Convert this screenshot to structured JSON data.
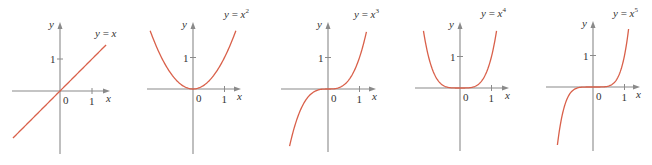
{
  "chart_data": [
    {
      "type": "line",
      "title": "y = x",
      "function": "x",
      "exponent": 1,
      "xlabel": "x",
      "ylabel": "y",
      "x_ticks": [
        "0",
        "1"
      ],
      "y_ticks": [
        "1"
      ],
      "xlim": [
        -1.5,
        1.5
      ],
      "ylim": [
        -1.5,
        1.6
      ],
      "x": [
        -1.5,
        -1,
        -0.5,
        0,
        0.5,
        1,
        1.5
      ],
      "y": [
        -1.5,
        -1,
        -0.5,
        0,
        0.5,
        1,
        1.5
      ],
      "legend": [],
      "grid": false
    },
    {
      "type": "line",
      "title": "y = x^2",
      "function": "x^2",
      "exponent": 2,
      "xlabel": "x",
      "ylabel": "y",
      "x_ticks": [
        "0",
        "1"
      ],
      "y_ticks": [
        "1"
      ],
      "xlim": [
        -1.4,
        1.4
      ],
      "ylim": [
        -2,
        2
      ],
      "x": [
        -1.35,
        -1,
        -0.5,
        0,
        0.5,
        1,
        1.35
      ],
      "y": [
        1.82,
        1,
        0.25,
        0,
        0.25,
        1,
        1.82
      ],
      "legend": [],
      "grid": false
    },
    {
      "type": "line",
      "title": "y = x^3",
      "function": "x^3",
      "exponent": 3,
      "xlabel": "x",
      "ylabel": "y",
      "x_ticks": [
        "0",
        "1"
      ],
      "y_ticks": [
        "1"
      ],
      "xlim": [
        -1.5,
        1.5
      ],
      "ylim": [
        -2,
        2
      ],
      "x": [
        -1.22,
        -1,
        -0.5,
        0,
        0.5,
        1,
        1.22
      ],
      "y": [
        -1.82,
        -1,
        -0.125,
        0,
        0.125,
        1,
        1.82
      ],
      "legend": [],
      "grid": false
    },
    {
      "type": "line",
      "title": "y = x^4",
      "function": "x^4",
      "exponent": 4,
      "xlabel": "x",
      "ylabel": "y",
      "x_ticks": [
        "0",
        "1"
      ],
      "y_ticks": [
        "1"
      ],
      "xlim": [
        -1.5,
        1.5
      ],
      "ylim": [
        -2,
        2
      ],
      "x": [
        -1.16,
        -1,
        -0.5,
        0,
        0.5,
        1,
        1.16
      ],
      "y": [
        1.82,
        1,
        0.0625,
        0,
        0.0625,
        1,
        1.82
      ],
      "legend": [],
      "grid": false
    },
    {
      "type": "line",
      "title": "y = x^5",
      "function": "x^5",
      "exponent": 5,
      "xlabel": "x",
      "ylabel": "y",
      "x_ticks": [
        "0",
        "1"
      ],
      "y_ticks": [
        "1"
      ],
      "xlim": [
        -1.5,
        1.5
      ],
      "ylim": [
        -2,
        2
      ],
      "x": [
        -1.13,
        -1,
        -0.5,
        0,
        0.5,
        1,
        1.13
      ],
      "y": [
        -1.85,
        -1,
        -0.03,
        0,
        0.03,
        1,
        1.85
      ],
      "legend": [],
      "grid": false
    }
  ],
  "panels": [
    {
      "label_base": "y = x",
      "label_sup": "",
      "origin": [
        60,
        91
      ],
      "unit": 32,
      "xaxis": [
        12,
        110
      ],
      "yaxis": [
        22,
        154
      ],
      "xmin": -1.47,
      "xmax": 1.44,
      "label_pos": [
        95,
        37
      ]
    },
    {
      "label_base": "y = x",
      "label_sup": "2",
      "origin": [
        193,
        89
      ],
      "unit": 31.5,
      "xaxis": [
        147,
        241
      ],
      "yaxis": [
        22,
        154
      ],
      "xmin": -1.36,
      "xmax": 1.36,
      "label_pos": [
        224,
        18
      ]
    },
    {
      "label_base": "y = x",
      "label_sup": "3",
      "origin": [
        328,
        89
      ],
      "unit": 31.5,
      "xaxis": [
        281,
        376
      ],
      "yaxis": [
        22,
        152
      ],
      "xmin": -1.22,
      "xmax": 1.22,
      "label_pos": [
        354,
        18
      ]
    },
    {
      "label_base": "y = x",
      "label_sup": "4",
      "origin": [
        460,
        88
      ],
      "unit": 31.5,
      "xaxis": [
        415,
        509
      ],
      "yaxis": [
        22,
        151
      ],
      "xmin": -1.16,
      "xmax": 1.16,
      "label_pos": [
        481,
        17
      ]
    },
    {
      "label_base": "y = x",
      "label_sup": "5",
      "origin": [
        593,
        87
      ],
      "unit": 31.5,
      "xaxis": [
        546,
        640
      ],
      "yaxis": [
        21,
        151
      ],
      "xmin": -1.13,
      "xmax": 1.13,
      "label_pos": [
        613,
        17
      ]
    }
  ],
  "colors": {
    "curve": "#d9604a",
    "axis": "#8a8a8a",
    "text": "#333333"
  }
}
